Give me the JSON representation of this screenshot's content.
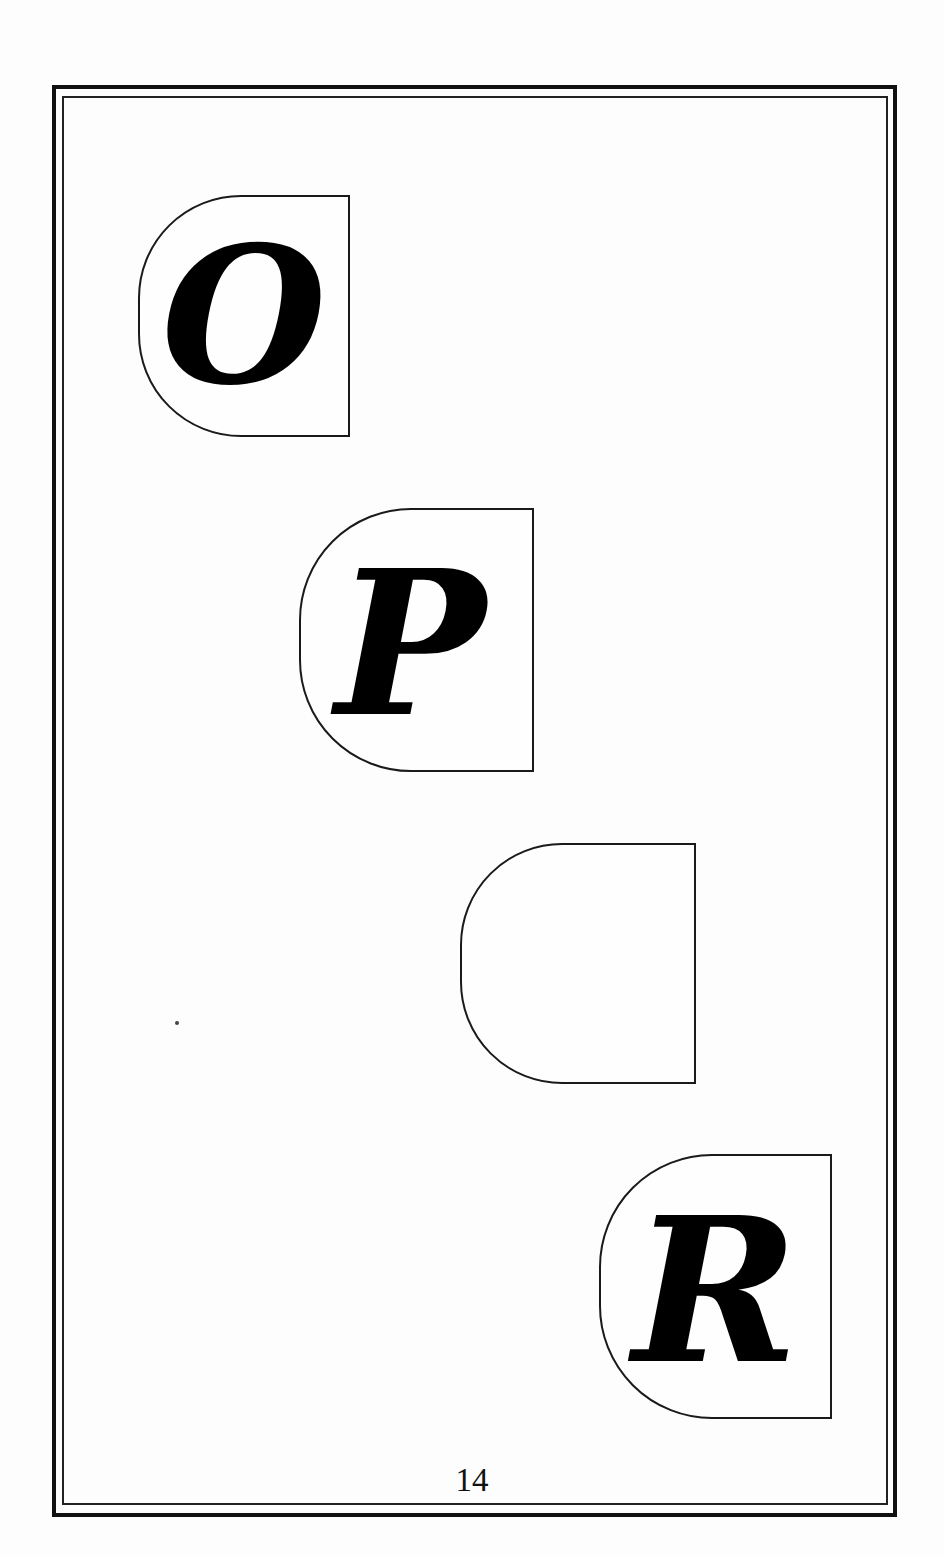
{
  "page": {
    "number": "14",
    "background": "#fdfdfd",
    "border_color": "#111111"
  },
  "tiles": [
    {
      "letter": "O",
      "x": 138,
      "y": 195,
      "width": 212,
      "height": 242,
      "font_size": 190,
      "offset_x": 0,
      "offset_y": 0
    },
    {
      "letter": "P",
      "x": 299,
      "y": 508,
      "width": 235,
      "height": 264,
      "font_size": 200,
      "offset_x": -6,
      "offset_y": 4
    },
    {
      "letter": "",
      "x": 460,
      "y": 843,
      "width": 236,
      "height": 241,
      "font_size": 190,
      "offset_x": 0,
      "offset_y": 0
    },
    {
      "letter": "R",
      "x": 599,
      "y": 1154,
      "width": 233,
      "height": 265,
      "font_size": 200,
      "offset_x": 0,
      "offset_y": 4
    }
  ]
}
